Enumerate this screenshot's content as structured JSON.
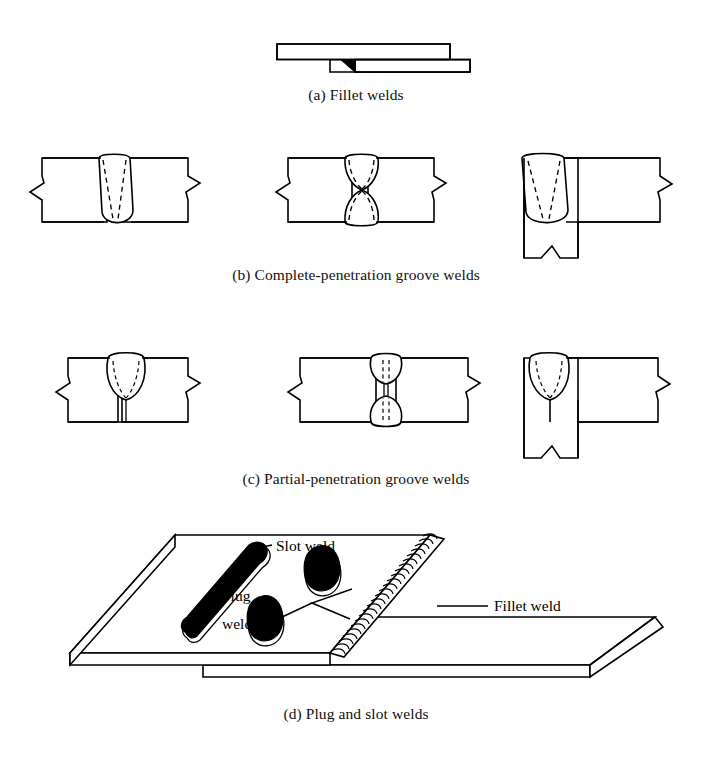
{
  "figure": {
    "background_color": "#ffffff",
    "line_color": "#000000",
    "weld_fill_color": "#000000"
  },
  "panels": [
    {
      "key": "a",
      "caption": "(a) Fillet welds",
      "description": "Two overlapping plates joined by a fillet weld at the lap",
      "parts": [
        {
          "name": "upper-plate",
          "label": ""
        },
        {
          "name": "lower-plate",
          "label": ""
        },
        {
          "name": "fillet-weld-triangle",
          "label": ""
        }
      ]
    },
    {
      "key": "b",
      "caption": "(b) Complete-penetration groove welds",
      "description": "Three complete-penetration groove weld joints",
      "details": [
        {
          "name": "single-v-butt-joint",
          "label": ""
        },
        {
          "name": "double-v-butt-joint",
          "label": ""
        },
        {
          "name": "tee-joint",
          "label": ""
        }
      ]
    },
    {
      "key": "c",
      "caption": "(c) Partial-penetration groove welds",
      "description": "Three partial-penetration groove weld joints",
      "details": [
        {
          "name": "single-v-partial-butt-joint",
          "label": ""
        },
        {
          "name": "double-v-partial-butt-joint",
          "label": ""
        },
        {
          "name": "tee-partial-joint",
          "label": ""
        }
      ]
    },
    {
      "key": "d",
      "caption": "(d) Plug and slot welds",
      "description": "Isometric view of two lapped plates with slot weld, plug welds and an edge fillet weld",
      "annotations": [
        {
          "name": "slot-weld-label",
          "text": "Slot weld"
        },
        {
          "name": "plug-welds-label-line1",
          "text": "Plug"
        },
        {
          "name": "plug-welds-label-line2",
          "text": "welds"
        },
        {
          "name": "fillet-weld-label",
          "text": "Fillet weld"
        }
      ]
    }
  ]
}
